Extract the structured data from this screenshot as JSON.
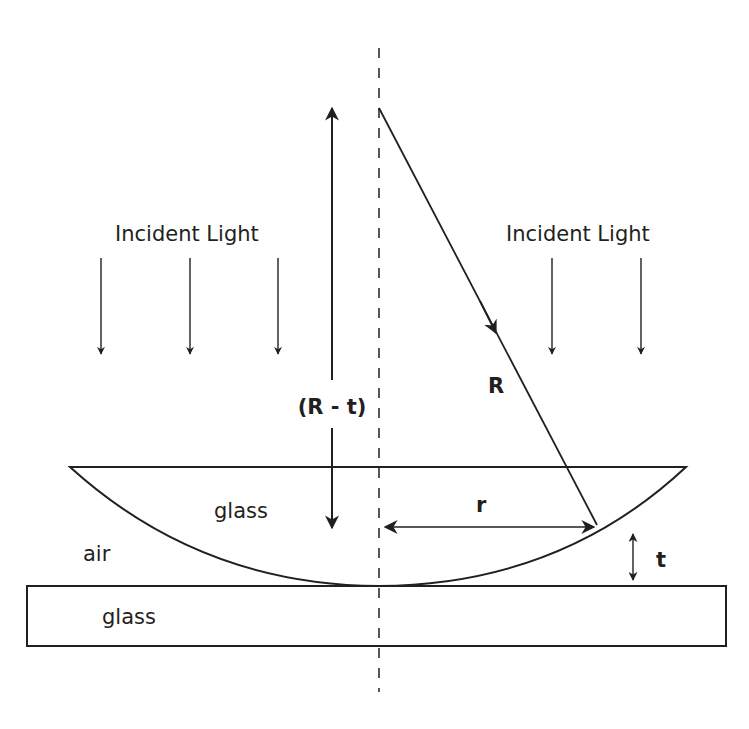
{
  "diagram": {
    "labels": {
      "incident_left": "Incident Light",
      "incident_right": "Incident Light",
      "radius": "R",
      "r_minus_t": "(R - t)",
      "lens_material": "glass",
      "gap_medium": "air",
      "plate_material": "glass",
      "ring_radius": "r",
      "thickness": "t"
    },
    "colors": {
      "stroke": "#231f20",
      "background": "#ffffff"
    },
    "elements": {
      "axis": "dashed vertical symmetry axis",
      "lens": "plano-convex lens, flat side up, curved surface touching plate",
      "plate": "flat glass plate",
      "incident_arrows_left": 3,
      "incident_arrows_right": 2
    }
  }
}
